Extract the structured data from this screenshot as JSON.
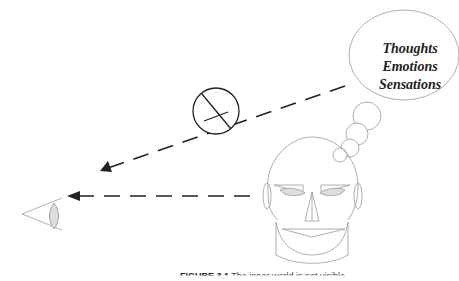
{
  "bubble": {
    "lines": [
      "Thoughts",
      "Emotions",
      "Sensations"
    ]
  },
  "caption": {
    "label": "FIGURE 3.1",
    "text": "The inner world is not visible"
  },
  "colors": {
    "line": "#999999",
    "arrow": "#222222",
    "fill": "#dddddd"
  }
}
